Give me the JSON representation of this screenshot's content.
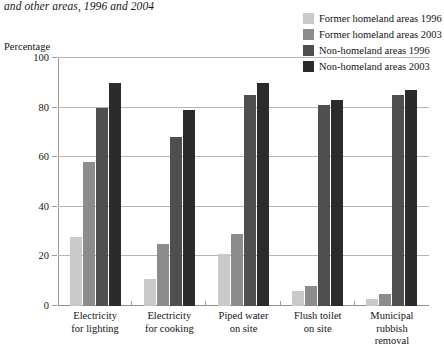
{
  "chart_data": {
    "type": "bar",
    "title": "and other areas, 1996 and 2004",
    "xlabel": "",
    "ylabel": "Percentage",
    "ylim": [
      0,
      100
    ],
    "yticks": [
      0,
      20,
      40,
      60,
      80,
      100
    ],
    "ytick_labels": [
      "0",
      "20",
      "40",
      "60",
      "80",
      "100"
    ],
    "grid": true,
    "legend_position": "top-right",
    "categories": [
      "Electricity for lighting",
      "Electricity for cooking",
      "Piped water on site",
      "Flush toilet on site",
      "Municipal rubbish removal"
    ],
    "category_lines": [
      [
        "Electricity",
        "for lighting"
      ],
      [
        "Electricity",
        "for cooking"
      ],
      [
        "Piped water",
        "on site"
      ],
      [
        "Flush toilet",
        "on site"
      ],
      [
        "Municipal",
        "rubbish",
        "removal"
      ]
    ],
    "series": [
      {
        "name": "Former homeland areas 1996",
        "color": "#c9c9c9",
        "values": [
          28,
          11,
          21,
          6,
          3
        ]
      },
      {
        "name": "Former homeland areas 2003",
        "color": "#8c8c8c",
        "values": [
          58,
          25,
          29,
          8,
          5
        ]
      },
      {
        "name": "Non-homeland areas 1996",
        "color": "#4f4f4f",
        "values": [
          80,
          68,
          85,
          81,
          85
        ]
      },
      {
        "name": "Non-homeland areas 2003",
        "color": "#2b2b2b",
        "values": [
          90,
          79,
          90,
          83,
          87
        ]
      }
    ]
  }
}
